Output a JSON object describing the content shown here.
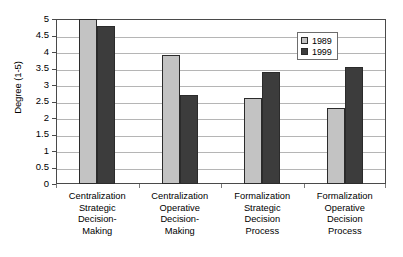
{
  "chart_data": {
    "type": "bar",
    "title": "",
    "xlabel": "",
    "ylabel": "Degree (1-5)",
    "ylim": [
      0,
      5
    ],
    "ytick_step": 0.5,
    "yticks": [
      "5",
      "4.5",
      "4",
      "3.5",
      "3",
      "2.5",
      "2",
      "1.5",
      "1",
      "0.5",
      "0"
    ],
    "grid": "horizontal",
    "legend_position": "top-right-inside",
    "categories": [
      "Centralization Strategic Decision-Making",
      "Centralization Operative Decision-Making",
      "Formalization Strategic Decision Process",
      "Formalization Operative Decision Process"
    ],
    "category_lines": [
      [
        "Centralization",
        "Strategic",
        "Decision-",
        "Making"
      ],
      [
        "Centralization",
        "Operative",
        "Decision-",
        "Making"
      ],
      [
        "Formalization",
        "Strategic",
        "Decision",
        "Process"
      ],
      [
        "Formalization",
        "Operative",
        "Decision",
        "Process"
      ]
    ],
    "series": [
      {
        "name": "1989",
        "color": "#c3c3c3",
        "values": [
          5.0,
          3.9,
          2.6,
          2.3
        ]
      },
      {
        "name": "1999",
        "color": "#3c3c3c",
        "values": [
          4.8,
          2.7,
          3.4,
          3.55
        ]
      }
    ]
  },
  "legend": {
    "items": [
      {
        "label": "1989",
        "color": "#c3c3c3"
      },
      {
        "label": "1999",
        "color": "#3c3c3c"
      }
    ]
  },
  "axis": {
    "y_title": "Degree (1-5)"
  }
}
